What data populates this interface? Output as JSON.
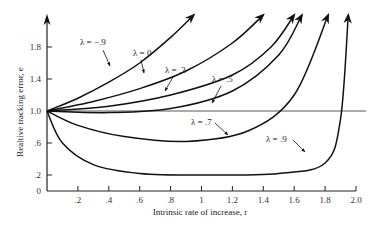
{
  "chart_data": {
    "type": "line",
    "title": "",
    "xlabel": "Intrinsic rate of increase, r",
    "ylabel": "Realtive tracking error, e",
    "xlim": [
      0,
      2.0
    ],
    "ylim": [
      0,
      2.0
    ],
    "x_ticks": [
      ".2",
      ".4",
      ".6",
      ".8",
      "1",
      "1.2",
      "1.4",
      "1.6",
      "1.8",
      "2.0"
    ],
    "y_ticks": [
      "0",
      ".2",
      ".6",
      "1.0",
      "1.4",
      "1.8"
    ],
    "grid": false,
    "reference_line": {
      "y": 1.0,
      "x_end": 2.0
    },
    "series": [
      {
        "name": "λ = −.9",
        "label": "λ = −.9",
        "x": [
          0,
          0.2,
          0.4,
          0.6,
          0.8,
          0.95
        ],
        "y": [
          1.0,
          1.16,
          1.36,
          1.6,
          1.92,
          2.2
        ],
        "arrow": true
      },
      {
        "name": "λ = 0",
        "label": "λ = 0",
        "x": [
          0,
          0.3,
          0.6,
          0.9,
          1.2,
          1.4
        ],
        "y": [
          1.0,
          1.12,
          1.28,
          1.5,
          1.85,
          2.2
        ],
        "arrow": true
      },
      {
        "name": "λ = .3",
        "label": "λ = .3",
        "x": [
          0,
          0.4,
          0.8,
          1.2,
          1.45,
          1.6
        ],
        "y": [
          1.0,
          1.06,
          1.2,
          1.45,
          1.8,
          2.2
        ],
        "arrow": true
      },
      {
        "name": "λ = .5",
        "label": "λ = .5",
        "x": [
          0,
          0.4,
          0.8,
          1.2,
          1.5,
          1.65
        ],
        "y": [
          1.0,
          0.98,
          1.03,
          1.25,
          1.7,
          2.2
        ],
        "arrow": true
      },
      {
        "name": "λ = .7",
        "label": "λ = .7",
        "x": [
          0,
          0.2,
          0.5,
          0.9,
          1.3,
          1.6,
          1.82
        ],
        "y": [
          1.0,
          0.82,
          0.68,
          0.62,
          0.75,
          1.2,
          2.2
        ],
        "arrow": true
      },
      {
        "name": "λ = .9",
        "label": "λ = .9",
        "x": [
          0,
          0.1,
          0.3,
          0.6,
          1.0,
          1.5,
          1.8,
          1.9,
          1.95
        ],
        "y": [
          1.0,
          0.6,
          0.33,
          0.22,
          0.2,
          0.22,
          0.35,
          0.9,
          2.2
        ],
        "arrow": true
      }
    ]
  }
}
